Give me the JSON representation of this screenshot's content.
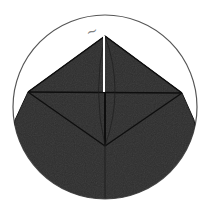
{
  "diagram": {
    "type": "geometric-figure",
    "labels": [
      {
        "id": "top-label",
        "text": "~",
        "x": 88,
        "y": 26
      }
    ],
    "colors": {
      "background": "#ffffff",
      "circle_stroke": "#555555",
      "fill": "#2e2e2e",
      "edge": "#111111",
      "highlight_line": "#ffffff",
      "label": "#808080"
    },
    "circle": {
      "cx": 105,
      "cy": 107,
      "r": 92
    },
    "points": {
      "apex": [
        105,
        36
      ],
      "left": [
        28,
        92
      ],
      "right": [
        182,
        93
      ],
      "left_arc": [
        15,
        120
      ],
      "right_arc": [
        194,
        120
      ],
      "bottom_vertex": [
        105,
        146
      ]
    }
  }
}
